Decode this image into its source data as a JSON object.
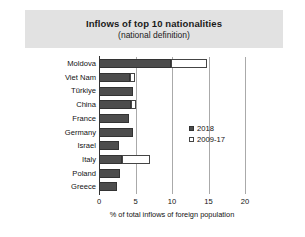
{
  "title": {
    "main": "Inflows of top 10 nationalities",
    "sub": "(national definition)"
  },
  "legend": {
    "items": [
      {
        "label": "2018",
        "swatch": "filled-dark-square"
      },
      {
        "label": "2009-17",
        "swatch": "open-white-square"
      }
    ]
  },
  "axis": {
    "x_title": "% of total inflows of foreign population",
    "x_ticks": [
      "0",
      "5",
      "10",
      "15",
      "20"
    ]
  },
  "colors": {
    "series_2018": "#4d4d4d",
    "series_2009_17": "#ffffff",
    "title_band": "#e2e2e2",
    "gridline": "#aaaaaa",
    "axis": "#333333"
  },
  "chart_data": {
    "type": "bar",
    "orientation": "horizontal",
    "stacked": true,
    "title": "Inflows of top 10 nationalities (national definition)",
    "xlabel": "% of total inflows of foreign population",
    "ylabel": "",
    "xlim": [
      0,
      20
    ],
    "xticks": [
      0,
      5,
      10,
      15,
      20
    ],
    "grid": true,
    "legend_position": "center-right",
    "categories": [
      "Moldova",
      "Viet Nam",
      "Türkiye",
      "China",
      "France",
      "Germany",
      "Israel",
      "Italy",
      "Poland",
      "Greece"
    ],
    "series": [
      {
        "name": "2018",
        "values": [
          9.9,
          4.3,
          4.6,
          4.4,
          4.1,
          4.6,
          2.7,
          3.1,
          2.9,
          2.4
        ]
      },
      {
        "name": "2009-17",
        "note": "outer extent of open bar (total), where visible",
        "totals": [
          14.8,
          5.0,
          4.6,
          5.1,
          4.1,
          4.6,
          2.7,
          7.0,
          2.9,
          2.4
        ]
      }
    ]
  }
}
